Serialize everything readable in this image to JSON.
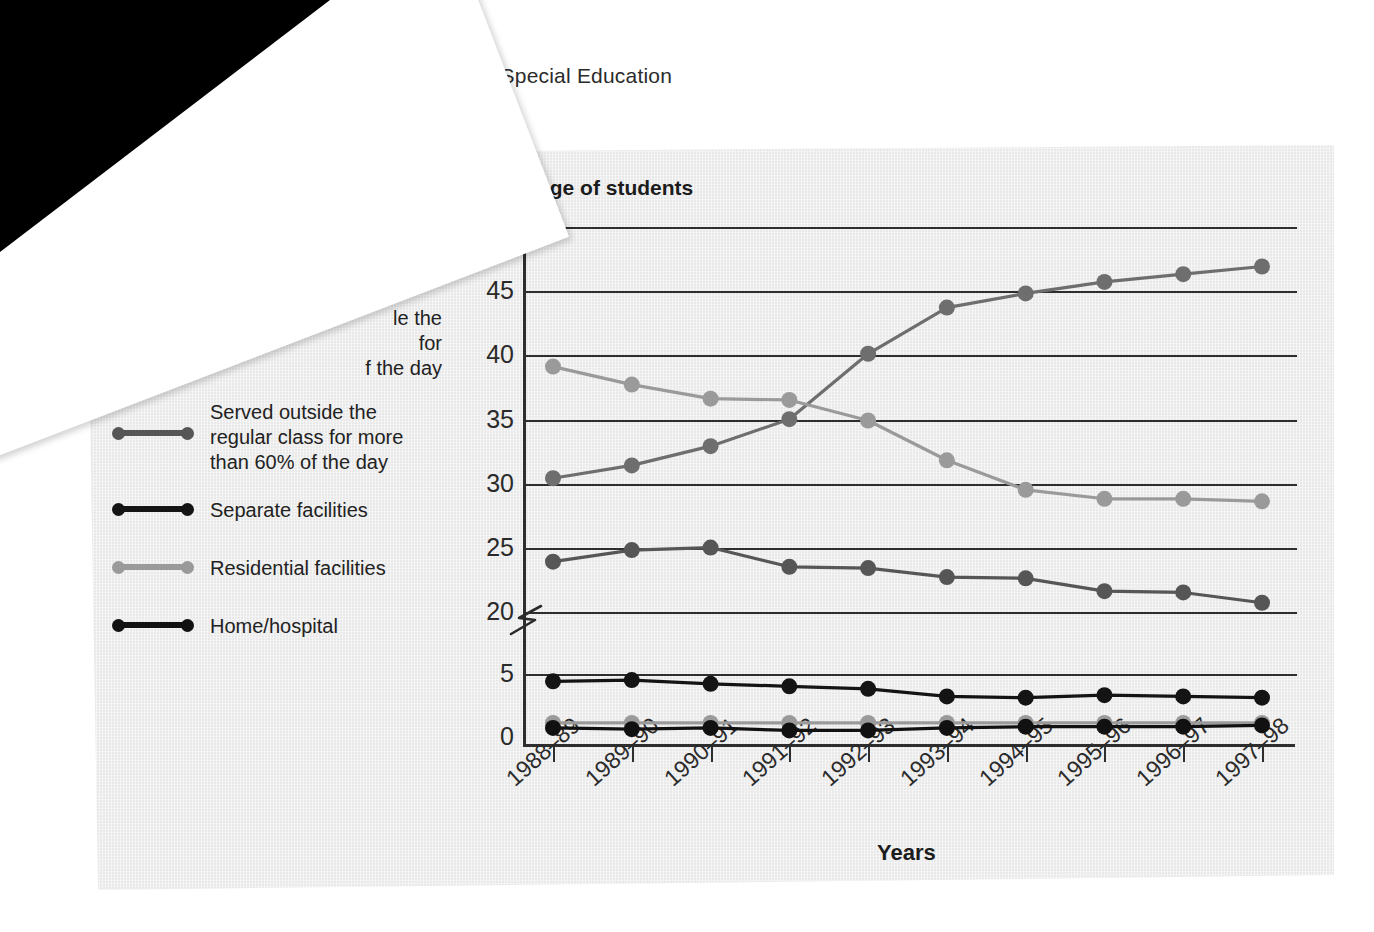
{
  "page": {
    "running_head": "ptionality and Special Education",
    "overlay_sheet": {
      "text_fragment_1": "ucation",
      "text_fragment_2": "17.",
      "marker_glyph": "p"
    }
  },
  "figure": {
    "y_axis_title": "Percentage of students",
    "x_axis_title": "Years",
    "y_tick_labels": [
      "0",
      "5",
      "20",
      "25",
      "30",
      "35",
      "40",
      "45",
      "50"
    ],
    "axis_break_symbol": "Z",
    "x_tick_labels": [
      "1988–89",
      "1989–90",
      "1990–91",
      "1991–92",
      "1992–93",
      "1993–94",
      "1994–95",
      "1995–96",
      "1996–97",
      "1997–98"
    ],
    "legend": [
      {
        "label": "the\nor\nof the day",
        "occluded": true,
        "color": "#8f8f8f",
        "name": "legend-item-occluded-1"
      },
      {
        "label": "le the\nfor\nf the day",
        "occluded": true,
        "color": "#5a5a5a",
        "name": "legend-item-occluded-2"
      },
      {
        "label": "Served outside the regular class for more than 60% of the day",
        "occluded": false,
        "color": "#565656",
        "name": "legend-item-served-outside"
      },
      {
        "label": "Separate facilities",
        "occluded": false,
        "color": "#141414",
        "name": "legend-item-separate-facilities"
      },
      {
        "label": "Residential facilities",
        "occluded": false,
        "color": "#9a9a9a",
        "name": "legend-item-residential-facilities"
      },
      {
        "label": "Home/hospital",
        "occluded": false,
        "color": "#111111",
        "name": "legend-item-home-hospital"
      }
    ],
    "colors": {
      "panel_background": "#e9e9e9",
      "axis": "#2e2e2e",
      "series_light_gray": "#9a9a9a",
      "series_mid_gray": "#6e6e6e",
      "series_dark_gray": "#565656",
      "series_black": "#141414"
    }
  },
  "chart_data": {
    "type": "line",
    "title": "",
    "xlabel": "Years",
    "ylabel": "Percentage of students",
    "grid": true,
    "legend_position": "left-outside",
    "ylim": [
      0,
      50
    ],
    "y_ticks": [
      0,
      5,
      20,
      25,
      30,
      35,
      40,
      45,
      50
    ],
    "y_axis_break_between": [
      5,
      20
    ],
    "categories": [
      "1988–89",
      "1989–90",
      "1990–91",
      "1991–92",
      "1992–93",
      "1993–94",
      "1994–95",
      "1995–96",
      "1996–97",
      "1997–98"
    ],
    "series": [
      {
        "name": "Served outside the regular class for less than 21% of the day",
        "color": "#6e6e6e",
        "values": [
          30.5,
          31.5,
          33.0,
          35.1,
          40.2,
          43.8,
          44.9,
          45.8,
          46.4,
          47.0
        ]
      },
      {
        "name": "Served outside the regular class for 21% to 60% of the day",
        "color": "#9a9a9a",
        "values": [
          39.2,
          37.8,
          36.7,
          36.6,
          35.0,
          31.9,
          29.6,
          28.9,
          28.9,
          28.7
        ]
      },
      {
        "name": "Served outside the regular class for more than 60% of the day",
        "color": "#565656",
        "values": [
          24.0,
          24.9,
          25.1,
          23.6,
          23.5,
          22.8,
          22.7,
          21.7,
          21.6,
          20.8
        ]
      },
      {
        "name": "Separate facilities",
        "color": "#141414",
        "values": [
          4.5,
          4.6,
          4.3,
          4.1,
          3.9,
          3.3,
          3.2,
          3.4,
          3.3,
          3.2
        ]
      },
      {
        "name": "Residential facilities",
        "color": "#9a9a9a",
        "values": [
          1.2,
          1.2,
          1.2,
          1.2,
          1.2,
          1.2,
          1.2,
          1.2,
          1.2,
          1.2
        ]
      },
      {
        "name": "Home/hospital",
        "color": "#111111",
        "values": [
          0.8,
          0.7,
          0.8,
          0.6,
          0.6,
          0.8,
          0.9,
          0.9,
          0.9,
          1.0
        ]
      }
    ]
  }
}
